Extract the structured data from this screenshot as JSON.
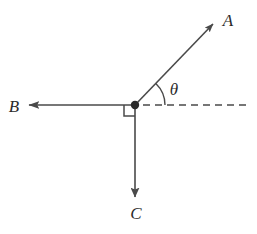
{
  "figure": {
    "background_color": "#ffffff",
    "line_color": "#4a4a4a",
    "label_color": "#2b2b2b",
    "width": 257,
    "height": 234
  },
  "origin": {
    "x": 135,
    "y": 105,
    "dot_radius": 4.2
  },
  "vectors": [
    {
      "id": "A",
      "label": "A",
      "label_x": 228,
      "label_y": 26,
      "from_x": 135,
      "from_y": 105,
      "to_x": 213,
      "to_y": 24,
      "direction": "up-right",
      "angle_from_horizontal_deg": 46
    },
    {
      "id": "B",
      "label": "B",
      "label_x": 14,
      "label_y": 112,
      "from_x": 135,
      "from_y": 105,
      "to_x": 29,
      "to_y": 105,
      "direction": "left",
      "angle_from_horizontal_deg": 180
    },
    {
      "id": "C",
      "label": "C",
      "label_x": 136,
      "label_y": 219,
      "from_x": 135,
      "from_y": 105,
      "to_x": 135,
      "to_y": 197,
      "direction": "down",
      "angle_from_horizontal_deg": 270
    }
  ],
  "reference_line": {
    "label": "horizontal-dashed-reference",
    "from_x": 143,
    "from_y": 105,
    "to_x": 251,
    "to_y": 105,
    "dash_length": 7,
    "gap_length": 5
  },
  "angle_arc": {
    "label": "θ",
    "label_x": 170,
    "label_y": 95,
    "radius": 30,
    "start_deg": 0,
    "end_deg": 46,
    "between": "A and horizontal reference"
  },
  "right_angle_marker": {
    "label": "right-angle-between-B-and-C",
    "x": 124,
    "y": 105,
    "size": 11,
    "corner": "lower-left-of-origin"
  }
}
